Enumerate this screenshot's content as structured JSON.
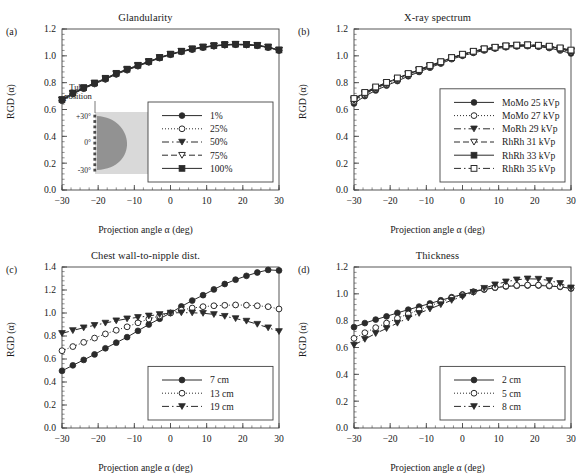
{
  "figure": {
    "axis_xlabel": "Projection angle α (deg)",
    "axis_ylabel": "RGD (α)",
    "xticks": [
      "-30",
      "-20",
      "-10",
      "0",
      "10",
      "20",
      "30"
    ],
    "yticks_12": [
      "0.0",
      "0.2",
      "0.4",
      "0.6",
      "0.8",
      "1.0",
      "1.2"
    ],
    "yticks_14": [
      "0.0",
      "0.2",
      "0.4",
      "0.6",
      "0.8",
      "1.0",
      "1.2",
      "1.4"
    ],
    "colors": {
      "line": "#2b2b2b",
      "axis": "#444444",
      "inset_bg": "#d9d9d9",
      "inset_breast": "#8c8c8c",
      "text": "#1a1a1a"
    }
  },
  "panels": [
    {
      "tag": "(a)",
      "title": "Glandularity",
      "inset": {
        "label_line1": "Tube",
        "label_line2": "position",
        "tick_top": "+30°",
        "tick_mid": "0°",
        "tick_bottom": "-30°"
      }
    },
    {
      "tag": "(b)",
      "title": "X-ray spectrum"
    },
    {
      "tag": "(c)",
      "title": "Chest wall-to-nipple dist."
    },
    {
      "tag": "(d)",
      "title": "Thickness"
    }
  ],
  "chart_data": [
    {
      "panel": "a",
      "type": "line",
      "title": "Glandularity",
      "xlabel": "Projection angle α (deg)",
      "ylabel": "RGD (α)",
      "xlim": [
        -30,
        30
      ],
      "ylim": [
        0.0,
        1.2
      ],
      "grid": false,
      "legend_position": "lower-right",
      "x": [
        -30,
        -27,
        -24,
        -21,
        -18,
        -15,
        -12,
        -9,
        -6,
        -3,
        0,
        3,
        6,
        9,
        12,
        15,
        18,
        21,
        24,
        27,
        30
      ],
      "series": [
        {
          "name": "1%",
          "marker": "filled-circle",
          "linestyle": "solid",
          "values": [
            0.665,
            0.715,
            0.755,
            0.79,
            0.825,
            0.862,
            0.893,
            0.923,
            0.952,
            0.983,
            1.008,
            1.03,
            1.047,
            1.062,
            1.072,
            1.08,
            1.083,
            1.081,
            1.075,
            1.062,
            1.04
          ]
        },
        {
          "name": "25%",
          "marker": "open-circle",
          "linestyle": "dotted",
          "values": [
            0.668,
            0.717,
            0.757,
            0.792,
            0.827,
            0.864,
            0.895,
            0.925,
            0.954,
            0.985,
            1.01,
            1.032,
            1.049,
            1.063,
            1.073,
            1.081,
            1.084,
            1.082,
            1.076,
            1.063,
            1.041
          ]
        },
        {
          "name": "50%",
          "marker": "filled-triangle",
          "linestyle": "dashdot",
          "values": [
            0.67,
            0.719,
            0.759,
            0.794,
            0.829,
            0.866,
            0.897,
            0.927,
            0.956,
            0.986,
            1.011,
            1.033,
            1.05,
            1.064,
            1.074,
            1.082,
            1.085,
            1.083,
            1.077,
            1.064,
            1.042
          ]
        },
        {
          "name": "75%",
          "marker": "open-triangle",
          "linestyle": "dashed",
          "values": [
            0.672,
            0.721,
            0.761,
            0.796,
            0.831,
            0.868,
            0.899,
            0.929,
            0.957,
            0.987,
            1.012,
            1.034,
            1.051,
            1.065,
            1.075,
            1.083,
            1.086,
            1.084,
            1.078,
            1.065,
            1.043
          ]
        },
        {
          "name": "100%",
          "marker": "filled-square",
          "linestyle": "solid",
          "values": [
            0.674,
            0.723,
            0.763,
            0.798,
            0.833,
            0.87,
            0.901,
            0.93,
            0.958,
            0.988,
            1.013,
            1.035,
            1.052,
            1.066,
            1.076,
            1.084,
            1.087,
            1.085,
            1.079,
            1.066,
            1.044
          ]
        }
      ]
    },
    {
      "panel": "b",
      "type": "line",
      "title": "X-ray spectrum",
      "xlabel": "Projection angle α (deg)",
      "ylabel": "RGD (α)",
      "xlim": [
        -30,
        30
      ],
      "ylim": [
        0.0,
        1.2
      ],
      "grid": false,
      "legend_position": "lower-right",
      "x": [
        -30,
        -27,
        -24,
        -21,
        -18,
        -15,
        -12,
        -9,
        -6,
        -3,
        0,
        3,
        6,
        9,
        12,
        15,
        18,
        21,
        24,
        27,
        30
      ],
      "series": [
        {
          "name": "MoMo 25 kVp",
          "marker": "filled-circle",
          "linestyle": "solid",
          "values": [
            0.645,
            0.7,
            0.742,
            0.778,
            0.812,
            0.848,
            0.88,
            0.912,
            0.942,
            0.975,
            1.0,
            1.022,
            1.04,
            1.054,
            1.064,
            1.07,
            1.072,
            1.068,
            1.058,
            1.04,
            1.018
          ]
        },
        {
          "name": "MoMo 27 kVp",
          "marker": "open-circle",
          "linestyle": "dotted",
          "values": [
            0.66,
            0.71,
            0.752,
            0.788,
            0.822,
            0.856,
            0.888,
            0.918,
            0.948,
            0.98,
            1.006,
            1.028,
            1.046,
            1.058,
            1.068,
            1.074,
            1.076,
            1.072,
            1.064,
            1.048,
            1.028
          ]
        },
        {
          "name": "MoRh 29 kVp",
          "marker": "filled-triangle",
          "linestyle": "dashdot",
          "values": [
            0.668,
            0.716,
            0.758,
            0.793,
            0.827,
            0.86,
            0.891,
            0.921,
            0.951,
            0.983,
            1.008,
            1.03,
            1.048,
            1.06,
            1.07,
            1.076,
            1.078,
            1.075,
            1.067,
            1.052,
            1.033
          ]
        },
        {
          "name": "RhRh 31 kVp",
          "marker": "open-triangle",
          "linestyle": "dashed",
          "values": [
            0.674,
            0.721,
            0.762,
            0.797,
            0.83,
            0.863,
            0.894,
            0.924,
            0.953,
            0.985,
            1.01,
            1.032,
            1.05,
            1.062,
            1.072,
            1.078,
            1.08,
            1.077,
            1.069,
            1.055,
            1.037
          ]
        },
        {
          "name": "RhRh 33 kVp",
          "marker": "filled-square",
          "linestyle": "solid",
          "values": [
            0.678,
            0.724,
            0.765,
            0.8,
            0.833,
            0.866,
            0.896,
            0.926,
            0.955,
            0.986,
            1.011,
            1.033,
            1.051,
            1.063,
            1.073,
            1.079,
            1.081,
            1.078,
            1.071,
            1.057,
            1.04
          ]
        },
        {
          "name": "RhRh 35 kVp",
          "marker": "open-square",
          "linestyle": "dashdot",
          "values": [
            0.682,
            0.727,
            0.768,
            0.802,
            0.835,
            0.868,
            0.898,
            0.928,
            0.956,
            0.987,
            1.012,
            1.034,
            1.052,
            1.064,
            1.074,
            1.08,
            1.082,
            1.079,
            1.072,
            1.059,
            1.043
          ]
        }
      ]
    },
    {
      "panel": "c",
      "type": "line",
      "title": "Chest wall-to-nipple dist.",
      "xlabel": "Projection angle α (deg)",
      "ylabel": "RGD (α)",
      "xlim": [
        -30,
        30
      ],
      "ylim": [
        0.0,
        1.4
      ],
      "grid": false,
      "legend_position": "lower-right",
      "x": [
        -30,
        -27,
        -24,
        -21,
        -18,
        -15,
        -12,
        -9,
        -6,
        -3,
        0,
        3,
        6,
        9,
        12,
        15,
        18,
        21,
        24,
        27,
        30
      ],
      "series": [
        {
          "name": "7 cm",
          "marker": "filled-circle",
          "linestyle": "solid",
          "values": [
            0.497,
            0.545,
            0.592,
            0.64,
            0.693,
            0.742,
            0.79,
            0.845,
            0.9,
            0.95,
            1.0,
            1.057,
            1.108,
            1.155,
            1.205,
            1.252,
            1.29,
            1.323,
            1.352,
            1.375,
            1.37
          ]
        },
        {
          "name": "13 cm",
          "marker": "open-circle",
          "linestyle": "dotted",
          "values": [
            0.672,
            0.708,
            0.745,
            0.782,
            0.818,
            0.85,
            0.88,
            0.915,
            0.948,
            0.975,
            1.0,
            1.025,
            1.043,
            1.055,
            1.063,
            1.067,
            1.07,
            1.068,
            1.063,
            1.055,
            1.035
          ]
        },
        {
          "name": "19 cm",
          "marker": "filled-triangle",
          "linestyle": "dashdot",
          "values": [
            0.823,
            0.848,
            0.872,
            0.893,
            0.913,
            0.933,
            0.95,
            0.962,
            0.975,
            0.988,
            1.0,
            1.003,
            1.002,
            0.998,
            0.988,
            0.972,
            0.952,
            0.93,
            0.903,
            0.872,
            0.84
          ]
        }
      ]
    },
    {
      "panel": "d",
      "type": "line",
      "title": "Thickness",
      "xlabel": "Projection angle α (deg)",
      "ylabel": "RGD (α)",
      "xlim": [
        -30,
        30
      ],
      "ylim": [
        0.0,
        1.2
      ],
      "grid": false,
      "legend_position": "lower-right",
      "x": [
        -30,
        -27,
        -24,
        -21,
        -18,
        -15,
        -12,
        -9,
        -6,
        -3,
        0,
        3,
        6,
        9,
        12,
        15,
        18,
        21,
        24,
        27,
        30
      ],
      "series": [
        {
          "name": "2 cm",
          "marker": "filled-circle",
          "linestyle": "solid",
          "values": [
            0.752,
            0.782,
            0.808,
            0.832,
            0.858,
            0.882,
            0.905,
            0.928,
            0.952,
            0.975,
            0.995,
            1.015,
            1.032,
            1.045,
            1.055,
            1.06,
            1.062,
            1.062,
            1.058,
            1.052,
            1.04
          ]
        },
        {
          "name": "5 cm",
          "marker": "open-circle",
          "linestyle": "dotted",
          "values": [
            0.668,
            0.71,
            0.748,
            0.782,
            0.818,
            0.85,
            0.88,
            0.91,
            0.94,
            0.968,
            0.992,
            1.015,
            1.035,
            1.048,
            1.058,
            1.063,
            1.065,
            1.065,
            1.062,
            1.055,
            1.042
          ]
        },
        {
          "name": "8 cm",
          "marker": "filled-triangle",
          "linestyle": "dashdot",
          "values": [
            0.618,
            0.662,
            0.705,
            0.742,
            0.782,
            0.82,
            0.855,
            0.888,
            0.92,
            0.952,
            0.98,
            1.012,
            1.042,
            1.068,
            1.09,
            1.105,
            1.112,
            1.11,
            1.1,
            1.078,
            1.045
          ]
        }
      ]
    }
  ]
}
